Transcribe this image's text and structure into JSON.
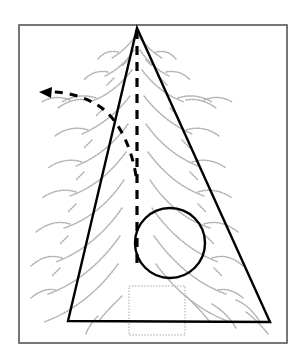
{
  "figure": {
    "canvas": {
      "width": 298,
      "height": 356,
      "background": "#ffffff"
    },
    "colors": {
      "frame": "#555555",
      "outline": "#000000",
      "dashed": "#000000",
      "tree": "#b3b3b3",
      "trunk": "#c8c8c8",
      "background": "#ffffff"
    },
    "frame": {
      "label": "diagram-border",
      "x": 19,
      "y": 25,
      "width": 268,
      "height": 318,
      "stroke_width": 1.6
    },
    "cone": {
      "label": "cone-triangle",
      "apex": {
        "x": 137,
        "y": 28
      },
      "base_left": {
        "x": 68,
        "y": 321
      },
      "base_right": {
        "x": 270,
        "y": 322
      },
      "stroke_width": 2.4,
      "points": "137,28 270,322 68,321"
    },
    "axis": {
      "label": "cone-axis",
      "style": "dashed",
      "x": 137,
      "y_top": 30,
      "y_bottom": 266,
      "stroke_width": 3.2,
      "dash_pattern": "9 7"
    },
    "arc": {
      "label": "angle-sweep-arc",
      "style": "dashed",
      "stroke_width": 3.0,
      "dash_pattern": "8 7",
      "path": "M 136,176 C 132,150 120,120 99,106 C 82,95 62,91 46,92",
      "arrow_tip": {
        "x": 39,
        "y": 92
      },
      "arrow_points": "39,92 52,87 51,98"
    },
    "circle": {
      "label": "sphere-circle",
      "cx": 170,
      "cy": 243,
      "r": 35,
      "stroke_width": 2.4
    },
    "trunk": {
      "label": "tree-trunk",
      "x": 129,
      "y": 286,
      "width": 56,
      "height": 49,
      "stroke_width": 1.6
    },
    "tree": {
      "label": "background-conifer",
      "stroke_width": 1.5,
      "branches": [
        "M 137,34 C 130,44 122,52 112,58",
        "M 137,34 C 144,44 152,52 162,58",
        "M 118,52 C 110,50 103,53 98,59",
        "M 156,52 C 164,50 171,53 176,59",
        "M 134,50 C 126,62 117,70 105,76",
        "M 140,50 C 148,62 157,70 169,76",
        "M 108,72 C 99,70 90,73 84,80",
        "M 166,72 C 175,70 184,73 190,80",
        "M 132,70 C 120,86 106,96 90,102",
        "M 142,70 C 154,86 168,96 184,102",
        "M 96,98 C 84,94 72,96 62,102",
        "M 178,98 C 190,94 202,96 212,102",
        "M 88,100 C 76,98 66,102 58,108",
        "M 186,100 C 198,98 208,102 216,108",
        "M 70,100 C 60,96 50,97 42,102",
        "M 204,100 C 214,96 224,97 232,102",
        "M 130,96 C 116,114 100,126 82,134",
        "M 144,96 C 158,114 174,126 192,134",
        "M 88,130 C 76,126 64,129 55,136",
        "M 186,130 C 198,126 210,129 219,136",
        "M 128,124 C 114,144 96,158 76,166",
        "M 146,124 C 160,144 178,158 198,166",
        "M 82,162 C 70,158 58,161 48,168",
        "M 192,162 C 204,158 216,161 226,168",
        "M 126,152 C 110,174 92,188 70,196",
        "M 148,152 C 164,174 182,188 204,196",
        "M 76,192 C 64,188 52,191 42,198",
        "M 198,192 C 210,188 222,191 232,198",
        "M 124,180 C 108,204 88,220 64,228",
        "M 150,180 C 166,204 186,220 210,228",
        "M 70,224 C 58,220 46,224 36,232",
        "M 204,224 C 216,220 228,224 238,232",
        "M 122,208 C 104,234 82,252 56,262",
        "M 152,208 C 170,234 192,252 218,262",
        "M 62,258 C 50,254 40,258 31,266",
        "M 212,258 C 224,254 234,258 243,266",
        "M 120,236 C 100,264 76,284 48,294",
        "M 154,236 C 174,264 198,284 226,294",
        "M 56,290 C 46,288 38,292 31,298",
        "M 218,290 C 228,288 236,292 243,298",
        "M 118,264 C 98,292 72,312 44,322",
        "M 156,264 C 176,292 202,312 230,322",
        "M 236,300 C 246,304 254,312 260,322",
        "M 246,312 C 254,318 262,326 268,334",
        "M 122,296 C 112,306 104,314 98,322",
        "M 186,296 C 196,306 204,314 210,322",
        "M 212,304 C 222,310 230,318 236,328",
        "M 98,316 C 92,322 88,328 86,334"
      ],
      "spines": [
        "M 128,60 L 122,66",
        "M 146,60 L 152,66",
        "M 114,78 L 107,85",
        "M 160,78 L 167,85",
        "M 104,108 L 96,116",
        "M 170,108 L 178,116",
        "M 92,140 L 84,148",
        "M 182,140 L 190,148",
        "M 84,172 L 76,180",
        "M 190,172 L 198,180",
        "M 76,204 L 68,212",
        "M 198,204 L 206,212",
        "M 68,236 L 60,244",
        "M 206,236 L 214,244",
        "M 60,268 L 52,276",
        "M 214,268 L 222,276"
      ]
    }
  }
}
